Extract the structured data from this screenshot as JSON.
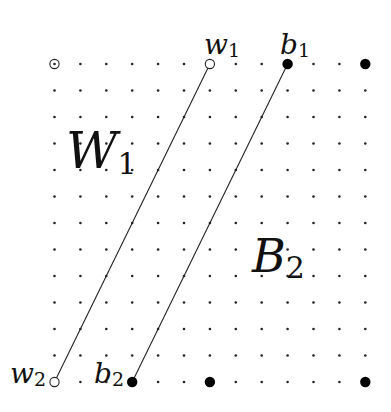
{
  "diagram": {
    "grid": {
      "columns": 13,
      "rows": 13,
      "x0": 54.5,
      "y0": 64,
      "dx": 25.9,
      "dy": 26.5,
      "dot_color": "#222222",
      "dot_radius": 1.3
    },
    "special_points": [
      {
        "id": "top-left-hollow",
        "col": 0,
        "row": 0,
        "kind": "hollow-dot"
      },
      {
        "id": "w1",
        "col": 6,
        "row": 0,
        "kind": "hollow"
      },
      {
        "id": "b1",
        "col": 9,
        "row": 0,
        "kind": "filled"
      },
      {
        "id": "top-right-filled",
        "col": 12,
        "row": 0,
        "kind": "filled"
      },
      {
        "id": "w2",
        "col": 0,
        "row": 12,
        "kind": "hollow"
      },
      {
        "id": "b2",
        "col": 3,
        "row": 12,
        "kind": "filled"
      },
      {
        "id": "bottom-mid-filled",
        "col": 6,
        "row": 12,
        "kind": "filled"
      },
      {
        "id": "bottom-right-filled",
        "col": 12,
        "row": 12,
        "kind": "filled"
      }
    ],
    "edges": [
      {
        "from": "w1",
        "to": "w2"
      },
      {
        "from": "b1",
        "to": "b2"
      }
    ],
    "labels": {
      "w1": {
        "main": "w",
        "sub": "1"
      },
      "b1": {
        "main": "b",
        "sub": "1"
      },
      "w2": {
        "main": "w",
        "sub": "2"
      },
      "b2": {
        "main": "b",
        "sub": "2"
      },
      "W1": {
        "main": "W",
        "sub": "1"
      },
      "B2": {
        "main": "B",
        "sub": "2"
      }
    }
  }
}
